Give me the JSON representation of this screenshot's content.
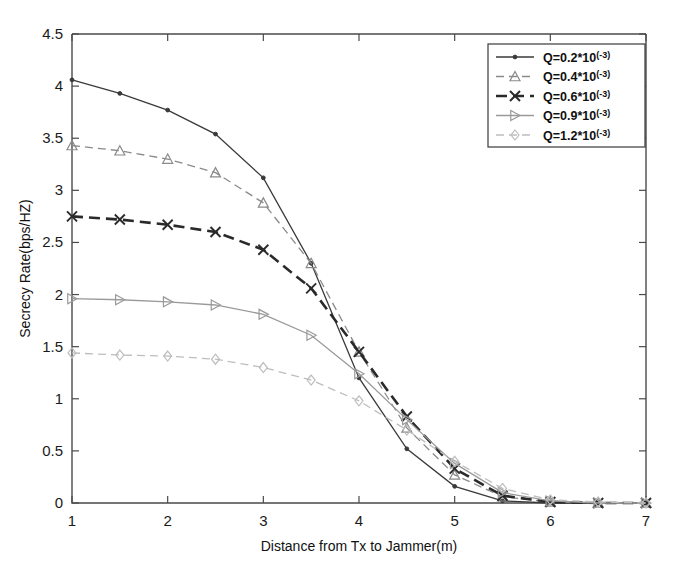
{
  "figure": {
    "background": "#ffffff",
    "frame_color": "#4a4a4a"
  },
  "axes": {
    "x_title": "Distance from Tx to Jammer(m)",
    "y_title": "Secrecy Rate(bps/HZ)",
    "x_ticks": [
      "1",
      "2",
      "3",
      "4",
      "5",
      "6",
      "7"
    ],
    "y_ticks": [
      "0",
      "0.5",
      "1",
      "1.5",
      "2",
      "2.5",
      "3",
      "3.5",
      "4",
      "4.5"
    ]
  },
  "legend": {
    "position": "top-right",
    "entries": [
      {
        "label": "Q=0.2*10",
        "exponent": "(-3)",
        "marker": "dot",
        "line": "solid",
        "color": "#3a3a3a"
      },
      {
        "label": "Q=0.4*10",
        "exponent": "(-3)",
        "marker": "triangle-up",
        "line": "dashed",
        "color": "#8a8a8a"
      },
      {
        "label": "Q=0.6*10",
        "exponent": "(-3)",
        "marker": "x-cross",
        "line": "dashed-bold",
        "color": "#2a2a2a"
      },
      {
        "label": "Q=0.9*10",
        "exponent": "(-3)",
        "marker": "triangle-right",
        "line": "solid",
        "color": "#9a9a9a"
      },
      {
        "label": "Q=1.2*10",
        "exponent": "(-3)",
        "marker": "diamond",
        "line": "dashed",
        "color": "#bdbdbd"
      }
    ]
  },
  "chart_data": {
    "type": "line",
    "title": "",
    "xlabel": "Distance from Tx to Jammer(m)",
    "ylabel": "Secrecy Rate(bps/HZ)",
    "xlim": [
      1,
      7
    ],
    "ylim": [
      0,
      4.5
    ],
    "xticks": [
      1,
      2,
      3,
      4,
      5,
      6,
      7
    ],
    "yticks": [
      0,
      0.5,
      1,
      1.5,
      2,
      2.5,
      3,
      3.5,
      4,
      4.5
    ],
    "grid": false,
    "legend_position": "upper right",
    "x": [
      1,
      1.5,
      2,
      2.5,
      3,
      3.5,
      4,
      4.5,
      5,
      5.5,
      6,
      6.5,
      7
    ],
    "series": [
      {
        "name": "Q=0.2*10(-3)",
        "marker": "dot",
        "linestyle": "solid",
        "color": "#3a3a3a",
        "values": [
          4.06,
          3.93,
          3.77,
          3.54,
          3.12,
          2.3,
          1.2,
          0.52,
          0.16,
          0.02,
          0.0,
          0.0,
          0.0
        ]
      },
      {
        "name": "Q=0.4*10(-3)",
        "marker": "triangle-up",
        "linestyle": "dashed",
        "color": "#8a8a8a",
        "values": [
          3.43,
          3.38,
          3.3,
          3.17,
          2.88,
          2.3,
          1.45,
          0.72,
          0.27,
          0.06,
          0.01,
          0.0,
          0.0
        ]
      },
      {
        "name": "Q=0.6*10(-3)",
        "marker": "x-cross",
        "linestyle": "dashed-bold",
        "color": "#2a2a2a",
        "values": [
          2.75,
          2.72,
          2.67,
          2.6,
          2.43,
          2.06,
          1.45,
          0.83,
          0.33,
          0.07,
          0.01,
          0.0,
          0.0
        ]
      },
      {
        "name": "Q=0.9*10(-3)",
        "marker": "triangle-right",
        "linestyle": "solid",
        "color": "#9a9a9a",
        "values": [
          1.96,
          1.95,
          1.93,
          1.9,
          1.81,
          1.61,
          1.24,
          0.8,
          0.38,
          0.1,
          0.02,
          0.0,
          0.0
        ]
      },
      {
        "name": "Q=1.2*10(-3)",
        "marker": "diamond",
        "linestyle": "dashed",
        "color": "#bdbdbd",
        "values": [
          1.44,
          1.42,
          1.41,
          1.38,
          1.3,
          1.18,
          0.98,
          0.7,
          0.4,
          0.14,
          0.03,
          0.01,
          0.0
        ]
      }
    ]
  }
}
